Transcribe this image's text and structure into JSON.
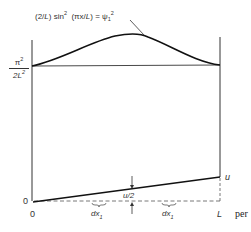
{
  "diagram": {
    "curve_label": {
      "prefix": "(2/",
      "L1": "L",
      "mid": ") sin",
      "sq1": "2",
      "open": "  (πx/",
      "L2": "L",
      "eq": ") = ψ",
      "sub": "1",
      "sq2": "2"
    },
    "y_level_label": {
      "numerator": "π",
      "numerator_sup": "2",
      "denominator": "2L",
      "denominator_sup": "2"
    },
    "origin_y_label": "0",
    "x_labels": {
      "origin": "0",
      "end": "L"
    },
    "right_label": "u",
    "midpoint_label": "u/2",
    "interval_labels": [
      {
        "base": "dx",
        "sub": "1"
      },
      {
        "base": "dx",
        "sub": "1"
      }
    ],
    "trailing_text": "per"
  }
}
